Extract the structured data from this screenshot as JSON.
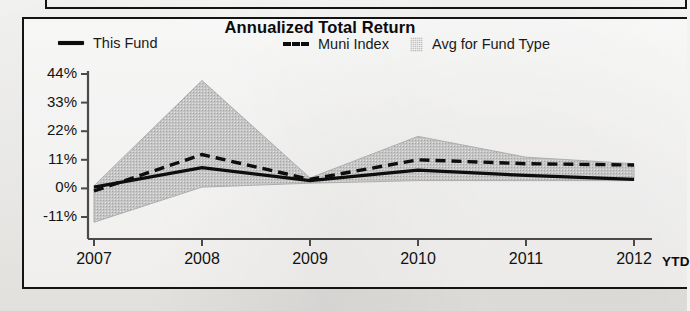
{
  "chart": {
    "title": "Annualized Total Return",
    "legend": [
      {
        "label": "This Fund",
        "marker": "solid-line-swatch"
      },
      {
        "label": "Muni Index",
        "marker": "dashed-line-swatch"
      },
      {
        "label": "Avg for Fund Type",
        "marker": "gray-band-swatch"
      }
    ]
  },
  "axes": {
    "y_ticks": [
      "44%",
      "33%",
      "22%",
      "11%",
      "0%",
      "-11%"
    ],
    "x_ticks": [
      "2007",
      "2008",
      "2009",
      "2010",
      "2011",
      "2012"
    ],
    "x_suffix": "YTD"
  },
  "colors": {
    "this_fund": "#0d0d0d",
    "muni_index": "#0d0d0d",
    "avg_band": "#bdbdbd",
    "axis": "#4a4a4a",
    "frame": "#141414"
  },
  "chart_data": {
    "type": "line",
    "title": "Annualized Total Return",
    "xlabel": "",
    "ylabel": "",
    "categories": [
      "2007",
      "2008",
      "2009",
      "2010",
      "2011",
      "2012 YTD"
    ],
    "ylim": [
      -11,
      44
    ],
    "ytick_values": [
      44,
      33,
      22,
      11,
      0,
      -11
    ],
    "grid": false,
    "legend_position": "top",
    "series": [
      {
        "name": "This Fund",
        "style": "solid",
        "values": [
          0.5,
          8.0,
          3.0,
          7.0,
          5.0,
          3.5
        ]
      },
      {
        "name": "Muni Index",
        "style": "dashed",
        "values": [
          -1.0,
          13.0,
          3.5,
          11.0,
          9.5,
          9.0
        ]
      },
      {
        "name": "Avg for Fund Type",
        "style": "band",
        "band_upper": [
          1.0,
          41.5,
          4.0,
          20.0,
          12.0,
          9.5
        ],
        "band_lower": [
          -13.0,
          0.5,
          2.0,
          3.0,
          3.0,
          3.0
        ]
      }
    ]
  }
}
